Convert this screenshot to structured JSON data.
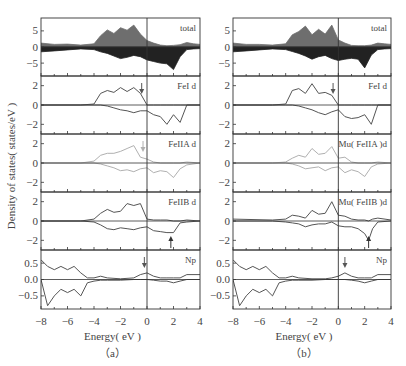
{
  "figure": {
    "ylabel": "Density of states( states/eV )",
    "xlabel": "Energy( eV )",
    "x_ticks": [
      "-8",
      "-6",
      "-4",
      "-2",
      "0",
      "2",
      "4"
    ],
    "captions": [
      "（a）",
      "（b）"
    ]
  },
  "colors": {
    "up_fill": "#6e6e6e",
    "down_fill": "#222222",
    "line_dark": "#555555",
    "line_light": "#b0b0b0",
    "axis": "#333333"
  },
  "chart_data": [
    {
      "type": "line",
      "title": "(a)",
      "xlabel": "Energy( eV )",
      "ylabel": "Density of states( states/eV )",
      "xlim": [
        -8,
        4
      ],
      "fermi_level": 0,
      "panels": [
        {
          "label": "total",
          "ylim": [
            -9,
            9
          ],
          "yticks": [
            "5",
            "0",
            "-5"
          ],
          "type": "area",
          "x": [
            -8,
            -7,
            -6,
            -5,
            -4,
            -3.5,
            -3,
            -2.5,
            -2,
            -1.5,
            -1,
            -0.5,
            0,
            0.5,
            1,
            1.5,
            2,
            2.5,
            3,
            3.5,
            4
          ],
          "series": [
            {
              "name": "spin up",
              "values": [
                1.2,
                0.8,
                0.9,
                0.6,
                1.0,
                3.5,
                5.3,
                4.2,
                6.0,
                5.2,
                6.8,
                4.0,
                2.0,
                1.2,
                0.6,
                0.4,
                0.5,
                0.7,
                1.4,
                1.0,
                0.8
              ]
            },
            {
              "name": "spin down",
              "values": [
                -1.5,
                -1.2,
                -0.9,
                -0.6,
                -0.8,
                -1.5,
                -2.0,
                -2.8,
                -3.6,
                -3.2,
                -2.6,
                -3.0,
                -4.0,
                -4.5,
                -5.0,
                -5.2,
                -7.0,
                -3.0,
                -0.8,
                -0.6,
                -0.5
              ]
            }
          ]
        },
        {
          "label": "FeI d",
          "ylim": [
            -3,
            3
          ],
          "yticks": [
            "2",
            "0",
            "-2"
          ],
          "arrow": {
            "x": -0.4,
            "direction": "down"
          },
          "x": [
            -8,
            -5,
            -4,
            -3.5,
            -3,
            -2.5,
            -2,
            -1.5,
            -1,
            -0.5,
            0,
            0.5,
            1,
            1.5,
            2,
            2.5,
            3,
            4
          ],
          "series": [
            {
              "name": "spin up",
              "values": [
                0,
                0,
                0.1,
                1.2,
                1.5,
                1.3,
                1.8,
                1.4,
                1.8,
                1.2,
                0,
                0,
                0,
                0,
                0,
                0,
                0,
                0
              ]
            },
            {
              "name": "spin down",
              "values": [
                0,
                0,
                0,
                0,
                -0.1,
                -0.3,
                -0.5,
                -0.6,
                -0.8,
                -0.6,
                -0.6,
                -1.0,
                -1.2,
                -2.0,
                -1.0,
                -1.8,
                0,
                0
              ]
            }
          ]
        },
        {
          "label": "FeIIA d",
          "ylim": [
            -3,
            3
          ],
          "yticks": [
            "2",
            "0",
            "-2"
          ],
          "arrow": {
            "x": -0.3,
            "direction": "down"
          },
          "color": "light",
          "x": [
            -8,
            -5,
            -4,
            -3.5,
            -3,
            -2.5,
            -2,
            -1.5,
            -1,
            -0.5,
            0,
            0.5,
            1,
            1.5,
            2,
            2.5,
            3,
            4
          ],
          "series": [
            {
              "name": "spin up",
              "values": [
                0,
                0,
                0.2,
                0.8,
                1.0,
                1.0,
                1.2,
                1.5,
                1.8,
                0.6,
                0.4,
                0.1,
                0,
                0,
                0,
                0,
                0.1,
                0
              ]
            },
            {
              "name": "spin down",
              "values": [
                0,
                0,
                0,
                -0.1,
                -0.3,
                -0.5,
                -0.8,
                -0.7,
                -0.9,
                -0.6,
                -0.5,
                -1.0,
                -0.8,
                -0.9,
                -1.5,
                -0.6,
                -0.2,
                0
              ]
            }
          ]
        },
        {
          "label": "FeIIB d",
          "ylim": [
            -3,
            3
          ],
          "yticks": [
            "2",
            "0",
            "-2"
          ],
          "arrow": {
            "x": 1.8,
            "direction": "up"
          },
          "x": [
            -8,
            -5,
            -4,
            -3.5,
            -3,
            -2.5,
            -2,
            -1.5,
            -1,
            -0.5,
            0,
            0.5,
            1,
            1.5,
            2,
            2.5,
            3,
            4
          ],
          "series": [
            {
              "name": "spin up",
              "values": [
                0,
                0,
                0.2,
                0.8,
                1.2,
                0.9,
                1.0,
                1.8,
                1.6,
                1.8,
                0.2,
                0.1,
                0.1,
                0.1,
                0,
                0,
                0.1,
                0
              ]
            },
            {
              "name": "spin down",
              "values": [
                0,
                0,
                -0.1,
                -0.4,
                -0.8,
                -0.9,
                -0.7,
                -0.8,
                -0.9,
                -0.7,
                -0.6,
                -1.0,
                -1.1,
                -1.2,
                -1.2,
                -0.2,
                -0.1,
                0
              ]
            }
          ]
        },
        {
          "label": "Np",
          "ylim": [
            -0.9,
            0.9
          ],
          "yticks": [
            "0.5",
            "0.0",
            "-0.5"
          ],
          "arrow": {
            "x": -0.2,
            "direction": "down"
          },
          "x": [
            -8,
            -7.5,
            -7,
            -6.5,
            -6,
            -5.5,
            -5,
            -4.5,
            -4,
            -3.5,
            -3,
            -2,
            -1,
            -0.5,
            0,
            0.5,
            1,
            1.5,
            2,
            2.5,
            3,
            4
          ],
          "series": [
            {
              "name": "spin up",
              "values": [
                0.6,
                0.4,
                0.3,
                0.4,
                0.3,
                0.4,
                0.2,
                0.05,
                0.05,
                0.1,
                0.05,
                0.02,
                0.05,
                0.15,
                0.2,
                0.1,
                0.05,
                0.05,
                0.05,
                0.05,
                0.15,
                0.15
              ]
            },
            {
              "name": "spin down",
              "values": [
                0,
                -0.8,
                -0.5,
                -0.3,
                -0.4,
                -0.3,
                -0.5,
                -0.1,
                -0.05,
                -0.02,
                -0.02,
                -0.02,
                0,
                0,
                0,
                -0.02,
                -0.05,
                -0.05,
                -0.1,
                -0.05,
                0,
                0
              ]
            }
          ]
        }
      ]
    },
    {
      "type": "line",
      "title": "(b)",
      "xlabel": "Energy( eV )",
      "ylabel": "",
      "xlim": [
        -8,
        4
      ],
      "fermi_level": 0,
      "panels": [
        {
          "label": "total",
          "ylim": [
            -9,
            9
          ],
          "yticks": [
            "5",
            "0",
            "-5"
          ],
          "type": "area",
          "x": [
            -8,
            -7,
            -6,
            -5,
            -4,
            -3.5,
            -3,
            -2.5,
            -2,
            -1.5,
            -1,
            -0.5,
            0,
            0.5,
            1,
            1.5,
            2,
            2.5,
            3,
            3.5,
            4
          ],
          "series": [
            {
              "name": "spin up",
              "values": [
                1.2,
                0.8,
                0.8,
                0.6,
                1.0,
                3.8,
                4.8,
                6.5,
                3.8,
                5.5,
                4.0,
                6.8,
                2.2,
                1.2,
                0.5,
                0.4,
                0.4,
                0.6,
                1.2,
                1.0,
                0.8
              ]
            },
            {
              "name": "spin down",
              "values": [
                -1.5,
                -1.2,
                -0.9,
                -0.6,
                -0.8,
                -1.4,
                -2.0,
                -2.8,
                -3.8,
                -3.0,
                -2.6,
                -3.6,
                -4.2,
                -3.8,
                -3.5,
                -3.8,
                -6.5,
                -2.5,
                -0.8,
                -0.6,
                -0.5
              ]
            }
          ]
        },
        {
          "label": "FeI d",
          "ylim": [
            -3,
            3
          ],
          "yticks": [
            "2",
            "0",
            "-2"
          ],
          "arrow": {
            "x": -0.4,
            "direction": "down"
          },
          "x": [
            -8,
            -5,
            -4,
            -3.5,
            -3,
            -2.5,
            -2,
            -1.5,
            -1,
            -0.5,
            0,
            0.5,
            1,
            1.5,
            2,
            2.5,
            3,
            4
          ],
          "series": [
            {
              "name": "spin up",
              "values": [
                0,
                0,
                0.1,
                1.5,
                1.7,
                1.2,
                2.2,
                1.2,
                1.3,
                1.0,
                0,
                0,
                0,
                0,
                0,
                0,
                0,
                0
              ]
            },
            {
              "name": "spin down",
              "values": [
                0,
                0,
                0,
                0,
                -0.1,
                -0.3,
                -0.5,
                -0.8,
                -1.0,
                -0.7,
                -0.5,
                -1.2,
                -1.4,
                -1.3,
                -1.0,
                -2.0,
                0,
                0
              ]
            }
          ]
        },
        {
          "label": "Mu( FeIIA )d",
          "ylim": [
            -3,
            3
          ],
          "yticks": [
            "2",
            "0",
            "-2"
          ],
          "color": "light",
          "x": [
            -8,
            -5,
            -4,
            -3.5,
            -3,
            -2.5,
            -2,
            -1.5,
            -1,
            -0.5,
            0,
            0.5,
            1,
            1.5,
            2,
            2.5,
            3,
            4
          ],
          "series": [
            {
              "name": "spin up",
              "values": [
                0,
                0,
                0.1,
                0.5,
                0.8,
                0.6,
                1.5,
                0.9,
                1.0,
                1.7,
                0.5,
                0.6,
                0.1,
                0,
                0,
                0,
                0.1,
                0
              ]
            },
            {
              "name": "spin down",
              "values": [
                0,
                0,
                0,
                -0.1,
                -0.3,
                -0.6,
                -0.5,
                -0.4,
                -0.8,
                -0.5,
                -0.4,
                -1.0,
                -0.7,
                -0.9,
                -1.4,
                -0.4,
                -0.1,
                0
              ]
            }
          ]
        },
        {
          "label": "Mu( FeIIB )d",
          "ylim": [
            -3,
            3
          ],
          "yticks": [
            "2",
            "0",
            "-2"
          ],
          "arrow": {
            "x": 2.3,
            "direction": "up"
          },
          "x": [
            -8,
            -5,
            -4,
            -3.5,
            -3,
            -2.5,
            -2,
            -1.5,
            -1,
            -0.5,
            0,
            0.5,
            1,
            1.5,
            2,
            2.3,
            2.6,
            3,
            4
          ],
          "series": [
            {
              "name": "spin up",
              "values": [
                0.2,
                0.1,
                0.2,
                0.6,
                0.5,
                0.3,
                1.1,
                0.7,
                0.8,
                2.0,
                0.6,
                0.5,
                0.2,
                0.1,
                0.1,
                0,
                0.2,
                0.3,
                0.1
              ]
            },
            {
              "name": "spin down",
              "values": [
                0,
                0,
                -0.1,
                -0.2,
                -0.3,
                -0.6,
                -0.4,
                -0.3,
                -0.3,
                -0.1,
                -0.5,
                -0.6,
                -0.6,
                -0.8,
                -1.3,
                -2.0,
                -0.8,
                -0.1,
                0
              ]
            }
          ]
        },
        {
          "label": "Np",
          "ylim": [
            -0.9,
            0.9
          ],
          "yticks": [
            "0.5",
            "0.0",
            "-0.5"
          ],
          "arrow": {
            "x": 0.5,
            "direction": "down"
          },
          "x": [
            -8,
            -7.5,
            -7,
            -6.5,
            -6,
            -5.5,
            -5,
            -4.5,
            -4,
            -3.5,
            -3,
            -2,
            -1,
            -0.5,
            0,
            0.5,
            1,
            1.5,
            2,
            2.5,
            3,
            4
          ],
          "series": [
            {
              "name": "spin up",
              "values": [
                0.6,
                0.4,
                0.3,
                0.4,
                0.3,
                0.4,
                0.2,
                0.05,
                0.05,
                0.1,
                0.05,
                0.02,
                0.02,
                0.05,
                0.1,
                0.2,
                0.1,
                0.05,
                0.05,
                0.05,
                0.15,
                0.15
              ]
            },
            {
              "name": "spin down",
              "values": [
                0,
                -0.8,
                -0.5,
                -0.3,
                -0.4,
                -0.3,
                -0.5,
                -0.1,
                -0.05,
                -0.02,
                -0.02,
                -0.02,
                0,
                0,
                0,
                0,
                -0.02,
                -0.05,
                -0.1,
                -0.05,
                0,
                0
              ]
            }
          ]
        }
      ]
    }
  ]
}
